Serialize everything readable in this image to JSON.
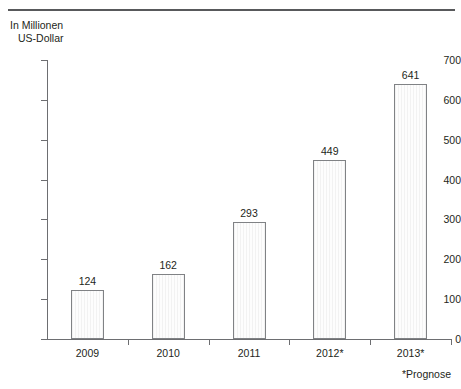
{
  "axis_caption": {
    "line1": "In Millionen",
    "line2": "US-Dollar"
  },
  "footnote": "*Prognose",
  "chart_data": {
    "type": "bar",
    "title": "",
    "subtitle": "",
    "xlabel": "",
    "ylabel": "In Millionen US-Dollar",
    "categories": [
      "2009",
      "2010",
      "2011",
      "2012*",
      "2013*"
    ],
    "values": [
      124,
      162,
      293,
      449,
      641
    ],
    "value_labels": [
      "124",
      "162",
      "293",
      "449",
      "641"
    ],
    "ylim": [
      0,
      700
    ],
    "yticks": [
      0,
      100,
      200,
      300,
      400,
      500,
      600,
      700
    ],
    "ytick_labels": [
      "0",
      "100",
      "200",
      "300",
      "400",
      "500",
      "600",
      "700"
    ],
    "grid": false,
    "legend": null,
    "annotations": [
      "*Prognose"
    ],
    "colors": {
      "bar_fill": "#fbfbfb",
      "bar_stripe": "#f2f2f2",
      "bar_border": "#808285",
      "axis": "#6d6e71",
      "text": "#231f20",
      "rule": "#58595b"
    }
  }
}
